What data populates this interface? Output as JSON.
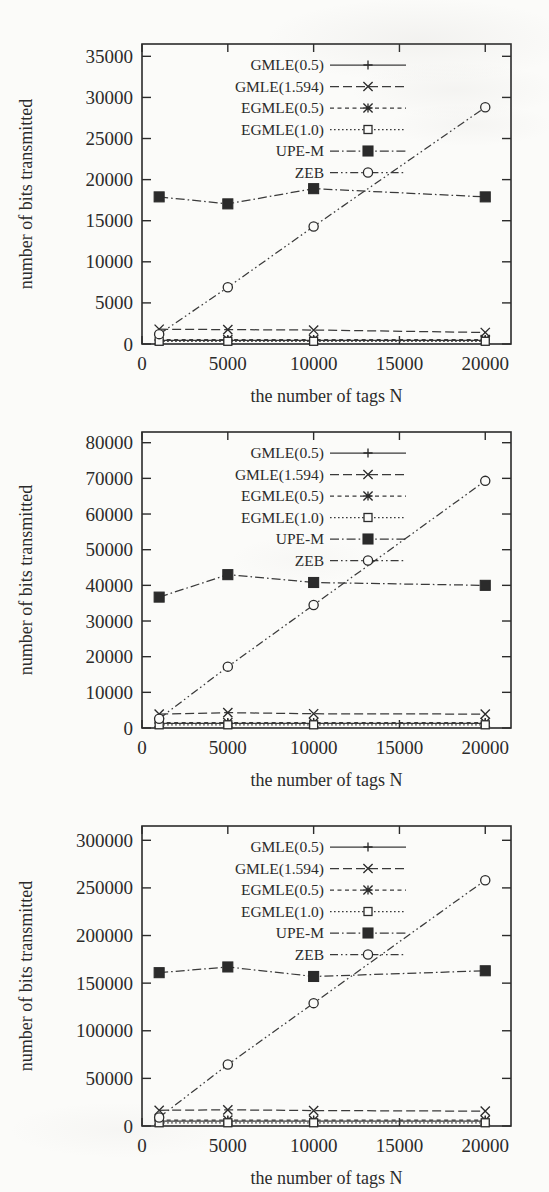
{
  "figure": {
    "background_color": "#fbfbf9",
    "ink_color": "#2b2b2b",
    "panel_count": 3
  },
  "series_names": [
    "GMLE(0.5)",
    "GMLE(1.594)",
    "EGMLE(0.5)",
    "EGMLE(1.0)",
    "UPE-M",
    "ZEB"
  ],
  "chart_data": [
    {
      "type": "line",
      "title": "",
      "xlabel": "the number of tags N",
      "ylabel": "number of bits transmitted",
      "x": [
        1000,
        5000,
        10000,
        20000
      ],
      "xlim": [
        0,
        21500
      ],
      "ylim": [
        0,
        36500
      ],
      "xticks": [
        0,
        5000,
        10000,
        15000,
        20000
      ],
      "xtick_labels": [
        "0",
        "5000",
        "10000",
        "15000",
        "20000"
      ],
      "yticks": [
        0,
        5000,
        10000,
        15000,
        20000,
        25000,
        30000,
        35000
      ],
      "ytick_labels": [
        "0",
        "5000",
        "10000",
        "15000",
        "20000",
        "25000",
        "30000",
        "35000"
      ],
      "grid": false,
      "legend_position": "top-center",
      "series": [
        {
          "name": "GMLE(0.5)",
          "values": [
            430,
            430,
            430,
            430
          ],
          "dash": "solid",
          "marker": "plus"
        },
        {
          "name": "GMLE(1.594)",
          "values": [
            1800,
            1750,
            1700,
            1400
          ],
          "dash": "dashed",
          "marker": "cross"
        },
        {
          "name": "EGMLE(0.5)",
          "values": [
            540,
            540,
            540,
            540
          ],
          "dash": "short-dash",
          "marker": "asterisk"
        },
        {
          "name": "EGMLE(1.0)",
          "values": [
            330,
            330,
            330,
            330
          ],
          "dash": "dotted",
          "marker": "open-square"
        },
        {
          "name": "UPE-M",
          "values": [
            17900,
            17050,
            18900,
            17900
          ],
          "dash": "dash-dot",
          "marker": "filled-square"
        },
        {
          "name": "ZEB",
          "values": [
            1200,
            6900,
            14300,
            28800
          ],
          "dash": "dash-dot-dot",
          "marker": "open-circle"
        }
      ]
    },
    {
      "type": "line",
      "title": "",
      "xlabel": "the number of tags N",
      "ylabel": "number of bits transmitted",
      "x": [
        1000,
        5000,
        10000,
        20000
      ],
      "xlim": [
        0,
        21500
      ],
      "ylim": [
        0,
        83000
      ],
      "xticks": [
        0,
        5000,
        10000,
        15000,
        20000
      ],
      "xtick_labels": [
        "0",
        "5000",
        "10000",
        "15000",
        "20000"
      ],
      "yticks": [
        0,
        10000,
        20000,
        30000,
        40000,
        50000,
        60000,
        70000,
        80000
      ],
      "ytick_labels": [
        "0",
        "10000",
        "20000",
        "30000",
        "40000",
        "50000",
        "60000",
        "70000",
        "80000"
      ],
      "grid": false,
      "legend_position": "top-center",
      "series": [
        {
          "name": "GMLE(0.5)",
          "values": [
            1300,
            1300,
            1300,
            1300
          ],
          "dash": "solid",
          "marker": "plus"
        },
        {
          "name": "GMLE(1.594)",
          "values": [
            3900,
            4300,
            4000,
            3900
          ],
          "dash": "dashed",
          "marker": "cross"
        },
        {
          "name": "EGMLE(0.5)",
          "values": [
            1500,
            1500,
            1500,
            1500
          ],
          "dash": "short-dash",
          "marker": "asterisk"
        },
        {
          "name": "EGMLE(1.0)",
          "values": [
            900,
            900,
            900,
            900
          ],
          "dash": "dotted",
          "marker": "open-square"
        },
        {
          "name": "UPE-M",
          "values": [
            36700,
            43000,
            40800,
            40000
          ],
          "dash": "dash-dot",
          "marker": "filled-square"
        },
        {
          "name": "ZEB",
          "values": [
            2600,
            17200,
            34500,
            69300
          ],
          "dash": "dash-dot-dot",
          "marker": "open-circle"
        }
      ]
    },
    {
      "type": "line",
      "title": "",
      "xlabel": "the number of tags N",
      "ylabel": "number of bits transmitted",
      "x": [
        1000,
        5000,
        10000,
        20000
      ],
      "xlim": [
        0,
        21500
      ],
      "ylim": [
        0,
        315000
      ],
      "xticks": [
        0,
        5000,
        10000,
        15000,
        20000
      ],
      "xtick_labels": [
        "0",
        "5000",
        "10000",
        "15000",
        "20000"
      ],
      "yticks": [
        0,
        50000,
        100000,
        150000,
        200000,
        250000,
        300000
      ],
      "ytick_labels": [
        "0",
        "50000",
        "100000",
        "150000",
        "200000",
        "250000",
        "300000"
      ],
      "grid": false,
      "legend_position": "top-center",
      "series": [
        {
          "name": "GMLE(0.5)",
          "values": [
            5200,
            5200,
            5200,
            5200
          ],
          "dash": "solid",
          "marker": "plus"
        },
        {
          "name": "GMLE(1.594)",
          "values": [
            16500,
            17000,
            16200,
            15600
          ],
          "dash": "dashed",
          "marker": "cross"
        },
        {
          "name": "EGMLE(0.5)",
          "values": [
            6200,
            6200,
            6200,
            6200
          ],
          "dash": "short-dash",
          "marker": "asterisk"
        },
        {
          "name": "EGMLE(1.0)",
          "values": [
            3400,
            3400,
            3400,
            3400
          ],
          "dash": "dotted",
          "marker": "open-square"
        },
        {
          "name": "UPE-M",
          "values": [
            161000,
            167000,
            157000,
            163000
          ],
          "dash": "dash-dot",
          "marker": "filled-square"
        },
        {
          "name": "ZEB",
          "values": [
            9000,
            64500,
            129000,
            258000
          ],
          "dash": "dash-dot-dot",
          "marker": "open-circle"
        }
      ]
    }
  ]
}
